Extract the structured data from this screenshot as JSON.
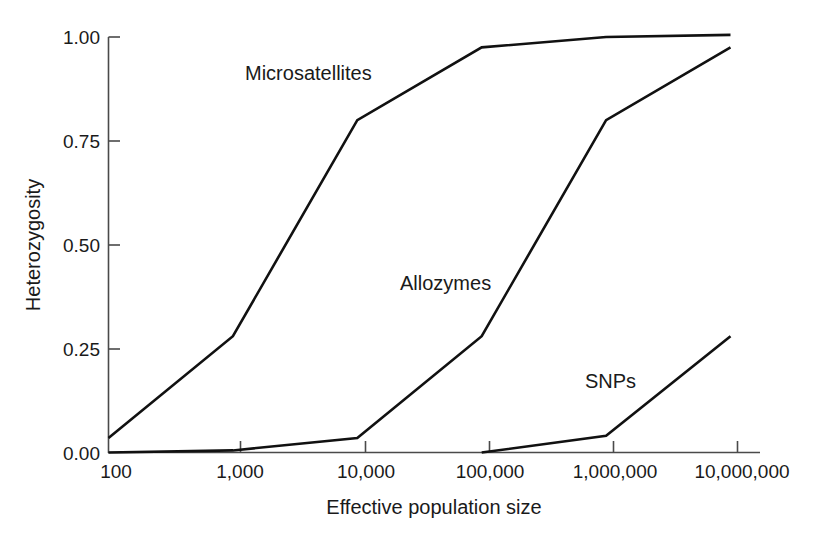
{
  "chart_data": {
    "type": "line",
    "title": "",
    "xlabel": "Effective population size",
    "ylabel": "Heterozygosity",
    "x_scale": "log",
    "x": [
      100,
      1000,
      10000,
      100000,
      1000000,
      10000000
    ],
    "categories": [
      "100",
      "1,000",
      "10,000",
      "100,000",
      "1,000,000",
      "10,000,000"
    ],
    "xticklabels": [
      "100",
      "1,000",
      "10,000",
      "100,000",
      "1,000,000",
      "10,000,000"
    ],
    "yticklabels": [
      "0.00",
      "0.25",
      "0.50",
      "0.75",
      "1.00"
    ],
    "yticks": [
      0.0,
      0.25,
      0.5,
      0.75,
      1.0
    ],
    "ylim": [
      0.0,
      1.0
    ],
    "xlim": [
      100,
      10000000
    ],
    "grid": false,
    "legend": "inline-annotations",
    "series": [
      {
        "name": "Microsatellites",
        "values": [
          0.035,
          0.28,
          0.8,
          0.975,
          1.0,
          1.005
        ],
        "color": "#111111"
      },
      {
        "name": "Allozymes",
        "values": [
          0.0,
          0.005,
          0.035,
          0.28,
          0.8,
          0.975
        ],
        "color": "#111111"
      },
      {
        "name": "SNPs",
        "values": [
          null,
          null,
          null,
          0.0,
          0.04,
          0.28
        ],
        "color": "#111111"
      }
    ],
    "annotations": [
      {
        "text": "Microsatellites",
        "x": 1500,
        "y": 0.93
      },
      {
        "text": "Allozymes",
        "x": 110000,
        "y": 0.45
      },
      {
        "text": "SNPs",
        "x": 1000000,
        "y": 0.17
      }
    ]
  },
  "axis": {
    "y_title": "Heterozygosity",
    "x_title": "Effective population size",
    "y_ticks": [
      {
        "label": "1.00"
      },
      {
        "label": "0.75"
      },
      {
        "label": "0.50"
      },
      {
        "label": "0.25"
      },
      {
        "label": "0.00"
      }
    ],
    "x_ticks": [
      {
        "label": "100"
      },
      {
        "label": "1,000"
      },
      {
        "label": "10,000"
      },
      {
        "label": "100,000"
      },
      {
        "label": "1,000,000"
      },
      {
        "label": "10,000,000"
      }
    ]
  },
  "series_labels": {
    "microsatellites": "Microsatellites",
    "allozymes": "Allozymes",
    "snps": "SNPs"
  },
  "colors": {
    "line": "#111111",
    "axis": "#4a4a4a",
    "text": "#1a1a1a",
    "background": "#ffffff"
  }
}
